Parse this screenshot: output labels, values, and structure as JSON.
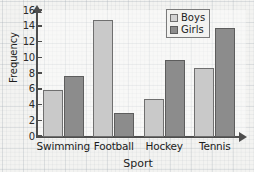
{
  "chart_data": {
    "type": "bar",
    "title": "",
    "xlabel": "Sport",
    "ylabel": "Frequency",
    "categories": [
      "Swimming",
      "Football",
      "Hockey",
      "Tennis"
    ],
    "series": [
      {
        "name": "Boys",
        "color": "#c9c9c9",
        "values": [
          6,
          14.8,
          4.8,
          8.8
        ]
      },
      {
        "name": "Girls",
        "color": "#8c8c8c",
        "values": [
          7.8,
          3,
          9.8,
          13.8
        ]
      }
    ],
    "ylim": [
      0,
      16
    ],
    "yticks": [
      0,
      2,
      4,
      6,
      8,
      10,
      12,
      14,
      16
    ],
    "ytick_labels": [
      "0",
      "2",
      "4",
      "6",
      "8",
      "10",
      "12",
      "14",
      "16"
    ],
    "grid": true,
    "grid_style": "graph-paper",
    "legend_position": "top-right",
    "axis_arrows": true
  },
  "legend": {
    "entries": [
      {
        "label": "Boys"
      },
      {
        "label": "Girls"
      }
    ]
  },
  "axes": {
    "y_title": "Frequency",
    "x_title": "Sport"
  }
}
